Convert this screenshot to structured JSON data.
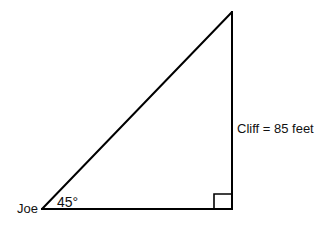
{
  "diagram": {
    "type": "right-triangle",
    "labels": {
      "observer": "Joe",
      "angle": "45°",
      "side": "Cliff = 85 feet"
    },
    "values": {
      "angle_degrees": 45,
      "cliff_height_feet": 85
    },
    "colors": {
      "stroke": "#000000",
      "background": "#ffffff",
      "text": "#111111"
    }
  }
}
